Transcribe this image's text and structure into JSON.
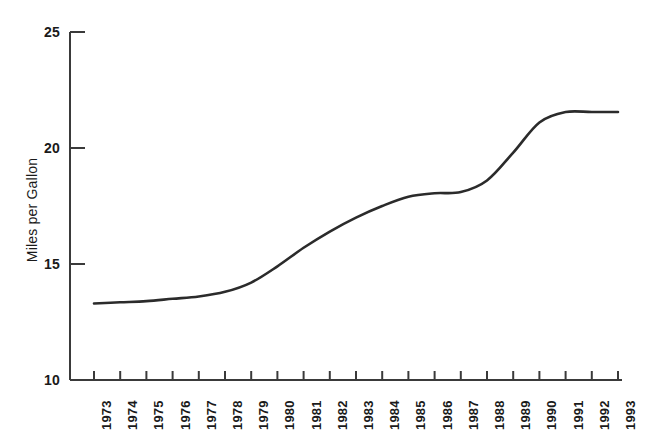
{
  "chart_data": {
    "type": "line",
    "title": "",
    "xlabel": "",
    "ylabel": "Miles per Gallon",
    "ylim": [
      10,
      25
    ],
    "yticks": [
      10,
      15,
      20,
      25
    ],
    "grid": false,
    "legend": null,
    "line_color": "#2b2b2b",
    "axis_color": "#3a3a3a",
    "categories": [
      "1973",
      "1974",
      "1975",
      "1976",
      "1977",
      "1978",
      "1979",
      "1980",
      "1981",
      "1982",
      "1983",
      "1984",
      "1985",
      "1986",
      "1987",
      "1988",
      "1989",
      "1990",
      "1991",
      "1992",
      "1993"
    ],
    "x": [
      1973,
      1974,
      1975,
      1976,
      1977,
      1978,
      1979,
      1980,
      1981,
      1982,
      1983,
      1984,
      1985,
      1986,
      1987,
      1988,
      1989,
      1990,
      1991,
      1992,
      1993
    ],
    "values": [
      13.3,
      13.35,
      13.4,
      13.5,
      13.6,
      13.8,
      14.2,
      14.9,
      15.7,
      16.4,
      17.0,
      17.5,
      17.9,
      18.05,
      18.1,
      18.6,
      19.8,
      21.1,
      21.55,
      21.55,
      21.55
    ],
    "series": [
      {
        "name": "Miles per Gallon",
        "values": [
          13.3,
          13.35,
          13.4,
          13.5,
          13.6,
          13.8,
          14.2,
          14.9,
          15.7,
          16.4,
          17.0,
          17.5,
          17.9,
          18.05,
          18.1,
          18.6,
          19.8,
          21.1,
          21.55,
          21.55,
          21.55
        ]
      }
    ]
  },
  "axes": {
    "y_title": "Miles per Gallon",
    "y_labels": [
      "25",
      "20",
      "15",
      "10"
    ],
    "x_labels": [
      "1973",
      "1974",
      "1975",
      "1976",
      "1977",
      "1978",
      "1979",
      "1980",
      "1981",
      "1982",
      "1983",
      "1984",
      "1985",
      "1986",
      "1987",
      "1988",
      "1989",
      "1990",
      "1991",
      "1992",
      "1993"
    ]
  }
}
